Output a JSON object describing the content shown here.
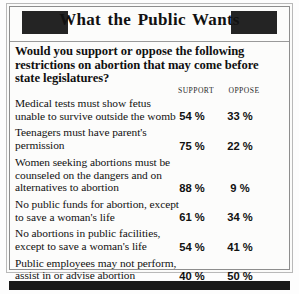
{
  "header": {
    "title": "What the Public Wants",
    "decor_block_left": "dark-rule-block",
    "decor_block_right": "dark-rule-block"
  },
  "question": "Would you support or oppose the following restrictions on abortion that may come before state legislatures?",
  "columns": {
    "label": "",
    "support": "SUPPORT",
    "oppose": "OPPOSE"
  },
  "chart_data": {
    "type": "table",
    "title": "What the Public Wants",
    "subtitle": "Would you support or oppose the following restrictions on abortion that may come before state legislatures?",
    "categories": [
      "Medical tests must show fetus unable to survive outside the womb",
      "Teenagers must have parent's permission",
      "Women seeking abortions must be counseled on the dangers and on alternatives to abortion",
      "No public funds for abortion, except to save a woman's life",
      "No abortions in public facilities, except to save a woman's life",
      "Public employees may not perform, assist in or advise abortion"
    ],
    "series": [
      {
        "name": "SUPPORT",
        "values": [
          54,
          75,
          88,
          61,
          54,
          40
        ]
      },
      {
        "name": "OPPOSE",
        "values": [
          33,
          22,
          9,
          34,
          41,
          50
        ]
      }
    ],
    "unit": "%",
    "xlabel": "",
    "ylabel": "",
    "ylim": [
      0,
      100
    ],
    "grid": false,
    "legend": "top"
  },
  "rows": [
    {
      "label": "Medical tests must show fetus unable to survive outside the womb",
      "support": "54 %",
      "oppose": "33 %"
    },
    {
      "label": "Teenagers must have parent's permission",
      "support": "75 %",
      "oppose": "22 %"
    },
    {
      "label": "Women seeking abortions must be counseled on the dangers and on alternatives to abortion",
      "support": "88 %",
      "oppose": "9 %"
    },
    {
      "label": "No public funds for abortion, except to save a woman's life",
      "support": "61 %",
      "oppose": "34 %"
    },
    {
      "label": "No abortions in public facilities, except to save a woman's life",
      "support": "54 %",
      "oppose": "41 %"
    },
    {
      "label": "Public employees may not perform, assist in or advise abortion",
      "support": "40 %",
      "oppose": "50 %"
    }
  ],
  "colors": {
    "ink": "#111111",
    "block": "#242424",
    "rule": "#8d8d8d",
    "paper": "#fcfcfb"
  }
}
